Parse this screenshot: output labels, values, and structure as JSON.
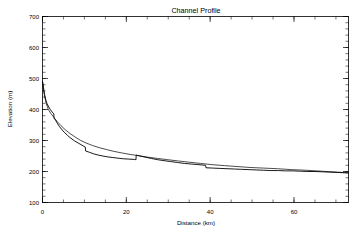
{
  "window": {
    "background_color": "#ffffff",
    "foreground_color": "#000000"
  },
  "chart_data": {
    "type": "line",
    "title": "Channel Profile",
    "xlabel": "Distance (km)",
    "ylabel": "Elevation (m)",
    "xlim": [
      0,
      73
    ],
    "ylim": [
      100,
      700
    ],
    "xticks": [
      0,
      20,
      40,
      60
    ],
    "xtick_labels": [
      "0",
      "20",
      "40",
      "60"
    ],
    "xminor_step": 5,
    "yticks": [
      100,
      200,
      300,
      400,
      500,
      600,
      700
    ],
    "ytick_labels": [
      "100",
      "200",
      "300",
      "400",
      "500",
      "600",
      "700"
    ],
    "yminor_step": 20,
    "grid": false,
    "legend": "none",
    "line_color": "#000000",
    "series": [
      {
        "name": "raw profile",
        "style": "stepped",
        "x": [
          0.0,
          0.25,
          0.5,
          0.8,
          1.1,
          1.5,
          1.9,
          2.3,
          2.7,
          2.75,
          3.1,
          3.6,
          4.1,
          4.7,
          5.3,
          6.0,
          6.8,
          7.6,
          8.5,
          9.4,
          10.2,
          10.3,
          11.2,
          12.2,
          13.3,
          14.4,
          15.6,
          16.8,
          18.0,
          19.3,
          20.6,
          21.9,
          22.3,
          22.35,
          23.2,
          24.6,
          26.0,
          27.5,
          29.0,
          30.6,
          32.2,
          33.9,
          35.6,
          37.3,
          38.9,
          39.0,
          40.6,
          42.3,
          44.0,
          45.8,
          47.5,
          49.3,
          51.0,
          52.8,
          54.5,
          56.3,
          58.0,
          59.8,
          61.5,
          63.3,
          65.0,
          66.8,
          68.5,
          70.3,
          72.0,
          73.0
        ],
        "y": [
          492,
          470,
          448,
          430,
          418,
          408,
          399,
          392,
          386,
          372,
          366,
          354,
          344,
          334,
          325,
          316,
          307,
          299,
          292,
          285,
          279,
          266,
          262,
          257,
          253,
          250,
          247,
          245,
          243,
          241,
          240,
          239,
          238,
          253,
          250,
          246,
          242,
          238,
          235,
          232,
          229,
          226,
          224,
          222,
          220,
          212,
          211,
          210,
          209,
          208,
          207,
          206,
          205,
          204,
          203,
          203,
          202,
          202,
          201,
          200,
          200,
          199,
          198,
          197,
          196,
          195
        ]
      },
      {
        "name": "smoothed profile",
        "style": "smooth",
        "x": [
          0.0,
          0.4,
          0.9,
          1.4,
          2.0,
          2.7,
          3.5,
          4.4,
          5.4,
          6.5,
          7.7,
          9.0,
          10.4,
          11.9,
          13.5,
          15.2,
          17.0,
          18.9,
          20.9,
          23.0,
          25.2,
          27.5,
          29.9,
          32.4,
          35.0,
          37.7,
          40.5,
          43.4,
          46.4,
          49.5,
          52.7,
          56.0,
          59.4,
          62.9,
          66.5,
          70.2,
          73.0
        ],
        "y": [
          488,
          449,
          419,
          400,
          387,
          375,
          361,
          348,
          335,
          323,
          312,
          301,
          292,
          284,
          277,
          271,
          265,
          260,
          255,
          251,
          246,
          242,
          238,
          234,
          230,
          226,
          222,
          219,
          216,
          213,
          211,
          209,
          206,
          204,
          201,
          198,
          196
        ]
      }
    ]
  }
}
